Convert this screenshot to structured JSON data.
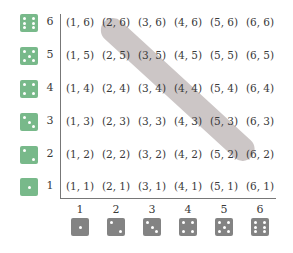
{
  "figure": {
    "colors": {
      "left_dice": "#78b98a",
      "bottom_dice": "#838383",
      "highlight_band": "#aaa0a0",
      "axis": "#777777"
    },
    "row_labels": [
      "6",
      "5",
      "4",
      "3",
      "2",
      "1"
    ],
    "col_labels": [
      "1",
      "2",
      "3",
      "4",
      "5",
      "6"
    ],
    "rows": [
      [
        "(1, 6)",
        "(2, 6)",
        "(3, 6)",
        "(4, 6)",
        "(5, 6)",
        "(6, 6)"
      ],
      [
        "(1, 5)",
        "(2, 5)",
        "(3, 5)",
        "(4, 5)",
        "(5, 5)",
        "(6, 5)"
      ],
      [
        "(1, 4)",
        "(2, 4)",
        "(3, 4)",
        "(4, 4)",
        "(5, 4)",
        "(6, 4)"
      ],
      [
        "(1, 3)",
        "(2, 3)",
        "(3, 3)",
        "(4, 3)",
        "(5, 3)",
        "(6, 3)"
      ],
      [
        "(1, 2)",
        "(2, 2)",
        "(3, 2)",
        "(4, 2)",
        "(5, 2)",
        "(6, 2)"
      ],
      [
        "(1, 1)",
        "(2, 1)",
        "(3, 1)",
        "(4, 1)",
        "(5, 1)",
        "(6, 1)"
      ]
    ],
    "highlighted": [
      "(2, 6)",
      "(3, 5)",
      "(4, 4)",
      "(5, 3)",
      "(6, 2)"
    ],
    "left_dice_faces": [
      6,
      5,
      4,
      3,
      2,
      1
    ],
    "bottom_dice_faces": [
      1,
      2,
      3,
      4,
      5,
      6
    ]
  }
}
